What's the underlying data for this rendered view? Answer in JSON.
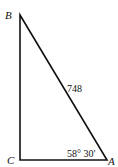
{
  "diagram": {
    "type": "right-triangle",
    "vertices": {
      "B": {
        "label": "B",
        "x": 20,
        "y": 15
      },
      "C": {
        "label": "C",
        "x": 20,
        "y": 160
      },
      "A": {
        "label": "A",
        "x": 107,
        "y": 160
      }
    },
    "hypotenuse_label": "748",
    "angle_label": "58° 30′",
    "right_angle_at": "C"
  }
}
